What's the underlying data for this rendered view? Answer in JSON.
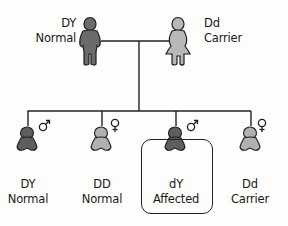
{
  "parents": [
    {
      "genotype": "DY",
      "phenotype": "Normal",
      "sex": "male",
      "color": "#6b6b6b"
    },
    {
      "genotype": "Dd",
      "phenotype": "Carrier",
      "sex": "female",
      "color": "#b8b8b8"
    }
  ],
  "children": [
    {
      "genotype": "DY",
      "phenotype": "Normal",
      "sex": "male",
      "symbol": "♂",
      "color": "#5e5e5e",
      "highlighted": false
    },
    {
      "genotype": "DD",
      "phenotype": "Normal",
      "sex": "female",
      "symbol": "♀",
      "color": "#b0b0b0",
      "highlighted": false
    },
    {
      "genotype": "dY",
      "phenotype": "Affected",
      "sex": "male",
      "symbol": "♂",
      "color": "#5e5e5e",
      "highlighted": true
    },
    {
      "genotype": "Dd",
      "phenotype": "Carrier",
      "sex": "female",
      "symbol": "♀",
      "color": "#b0b0b0",
      "highlighted": false
    }
  ]
}
